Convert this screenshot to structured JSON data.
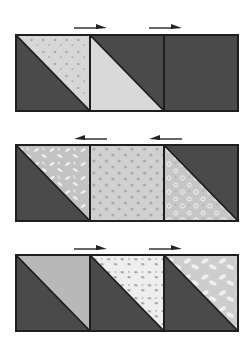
{
  "colors": {
    "dark": "#4a4a4a",
    "outline": "#1e1e1e",
    "light_speckle": "#d6d6d6",
    "light_dots": "#cfcfcf",
    "light_leaf": "#c4c4c4",
    "light_flower": "#c8c8c8",
    "light_plain": "#bdbdbd",
    "light_floral": "#e8e8e8",
    "light_leaf2": "#d0d0d0"
  },
  "rows": [
    {
      "arrows": [
        "right",
        "right"
      ],
      "squares": [
        {
          "type": "hst",
          "dark": "lower-left",
          "fabric": "speckle"
        },
        {
          "type": "hst",
          "dark": "upper-right",
          "fabric": "plain-light"
        },
        {
          "type": "solid",
          "dark": "full",
          "fabric": "dark"
        }
      ]
    },
    {
      "arrows": [
        "left",
        "left"
      ],
      "squares": [
        {
          "type": "hst",
          "dark": "lower-left",
          "fabric": "leaf"
        },
        {
          "type": "solid",
          "dark": "none",
          "fabric": "dots"
        },
        {
          "type": "hst",
          "dark": "upper-right",
          "fabric": "flower"
        }
      ]
    },
    {
      "arrows": [
        "right",
        "right"
      ],
      "squares": [
        {
          "type": "hst",
          "dark": "lower-left",
          "fabric": "plain"
        },
        {
          "type": "hst",
          "dark": "lower-left",
          "fabric": "floral-white"
        },
        {
          "type": "hst",
          "dark": "lower-left",
          "fabric": "leaf-light"
        }
      ]
    }
  ]
}
